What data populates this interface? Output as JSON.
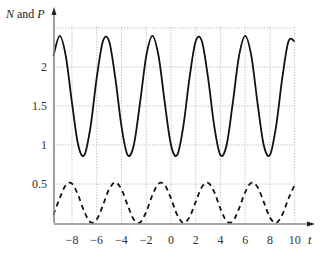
{
  "chart_data": {
    "type": "line",
    "title": "",
    "xlabel": "t",
    "ylabel": "N and P",
    "xlim": [
      -9.5,
      11.5
    ],
    "ylim": [
      0,
      2.55
    ],
    "grid": true,
    "grid_style": "dotted",
    "legend": null,
    "x_ticks": [
      -8,
      -6,
      -4,
      -2,
      0,
      2,
      4,
      6,
      8,
      10
    ],
    "x_tick_labels": [
      "−8",
      "−6",
      "−4",
      "−2",
      "0",
      "2",
      "4",
      "6",
      "8",
      "10"
    ],
    "y_ticks": [
      0.5,
      1,
      1.5,
      2
    ],
    "y_tick_labels": [
      "0.5",
      "1",
      "1.5",
      "2"
    ],
    "x": [
      -9.5,
      -9,
      -8.5,
      -8,
      -7.5,
      -7,
      -6.5,
      -6,
      -5.5,
      -5,
      -4.5,
      -4,
      -3.5,
      -3,
      -2.5,
      -2,
      -1.5,
      -1,
      -0.5,
      0,
      0.5,
      1,
      1.5,
      2,
      2.5,
      3,
      3.5,
      4,
      4.5,
      5,
      5.5,
      6,
      6.5,
      7,
      7.5,
      8,
      8.5,
      9,
      9.5,
      10
    ],
    "series": [
      {
        "name": "N",
        "style": "solid",
        "color": "#111111",
        "values": [
          2.14,
          2.4,
          2.14,
          1.54,
          1.0,
          0.87,
          1.24,
          1.86,
          2.33,
          2.33,
          1.86,
          1.24,
          0.87,
          1.0,
          1.54,
          2.14,
          2.4,
          2.14,
          1.54,
          1.0,
          0.87,
          1.24,
          1.86,
          2.33,
          2.33,
          1.86,
          1.24,
          0.87,
          1.0,
          1.54,
          2.14,
          2.4,
          2.14,
          1.54,
          1.0,
          0.87,
          1.24,
          1.86,
          2.33,
          2.33
        ]
      },
      {
        "name": "P",
        "style": "dashed",
        "color": "#111111",
        "values": [
          0.105,
          0.315,
          0.487,
          0.505,
          0.357,
          0.143,
          0.009,
          0.045,
          0.227,
          0.432,
          0.52,
          0.432,
          0.227,
          0.045,
          0.008,
          0.143,
          0.357,
          0.505,
          0.487,
          0.315,
          0.106,
          0.001,
          0.076,
          0.271,
          0.462,
          0.516,
          0.396,
          0.184,
          0.023,
          0.023,
          0.184,
          0.396,
          0.516,
          0.462,
          0.271,
          0.072,
          0.001,
          0.107,
          0.314,
          0.487
        ]
      }
    ]
  },
  "labels": {
    "y_axis_title_italic_1": "N",
    "y_axis_title_plain": " and ",
    "y_axis_title_italic_2": "P",
    "x_axis_title": "t"
  },
  "colors": {
    "axis": "#888888",
    "grid": "#aaaaaa",
    "curve": "#111111"
  }
}
